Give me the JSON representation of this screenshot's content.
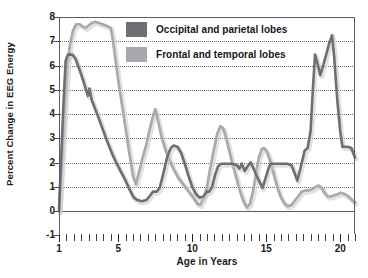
{
  "chart_data": {
    "type": "line",
    "title": "",
    "xlabel": "Age in Years",
    "ylabel": "Percent Change in EEG Energy",
    "xlim": [
      1,
      21
    ],
    "ylim": [
      -1,
      8
    ],
    "yticks": [
      8,
      7,
      6,
      5,
      4,
      3,
      2,
      1,
      0,
      -1
    ],
    "xticks_major": [
      1,
      5,
      10,
      15,
      20
    ],
    "xtick_minor_step": 0.5,
    "grid": "horizontal-dotted",
    "legend_position": "top-center",
    "colors": {
      "occipital_parietal": "#6e6e73",
      "frontal_temporal": "#a8a8ad",
      "axis": "#5a5a6a",
      "grid": "#6b6b6b",
      "text": "#1a1a1a",
      "background": "#ffffff"
    },
    "series": [
      {
        "name": "Occipital and parietal lobes",
        "color": "#6e6e73",
        "points": [
          [
            1.0,
            0.05
          ],
          [
            1.15,
            2.2
          ],
          [
            1.3,
            4.4
          ],
          [
            1.45,
            6.2
          ],
          [
            1.6,
            6.45
          ],
          [
            1.9,
            6.45
          ],
          [
            2.1,
            6.3
          ],
          [
            2.35,
            5.9
          ],
          [
            2.6,
            5.45
          ],
          [
            2.8,
            5.05
          ],
          [
            2.95,
            4.75
          ],
          [
            3.05,
            5.05
          ],
          [
            3.2,
            4.6
          ],
          [
            3.45,
            4.2
          ],
          [
            3.7,
            3.8
          ],
          [
            4.0,
            3.3
          ],
          [
            4.3,
            2.8
          ],
          [
            4.6,
            2.35
          ],
          [
            4.9,
            1.95
          ],
          [
            5.2,
            1.6
          ],
          [
            5.5,
            1.25
          ],
          [
            5.8,
            0.85
          ],
          [
            6.05,
            0.55
          ],
          [
            6.3,
            0.45
          ],
          [
            6.6,
            0.4
          ],
          [
            6.9,
            0.45
          ],
          [
            7.1,
            0.6
          ],
          [
            7.35,
            0.8
          ],
          [
            7.6,
            0.8
          ],
          [
            7.8,
            0.95
          ],
          [
            8.05,
            1.55
          ],
          [
            8.3,
            2.2
          ],
          [
            8.55,
            2.6
          ],
          [
            8.75,
            2.7
          ],
          [
            9.0,
            2.65
          ],
          [
            9.25,
            2.4
          ],
          [
            9.5,
            1.95
          ],
          [
            9.75,
            1.45
          ],
          [
            10.0,
            1.0
          ],
          [
            10.25,
            0.7
          ],
          [
            10.5,
            0.55
          ],
          [
            10.75,
            0.6
          ],
          [
            11.0,
            0.8
          ],
          [
            11.15,
            0.8
          ],
          [
            11.35,
            1.0
          ],
          [
            11.55,
            1.5
          ],
          [
            11.75,
            1.85
          ],
          [
            11.95,
            1.95
          ],
          [
            12.3,
            1.95
          ],
          [
            12.7,
            1.95
          ],
          [
            13.0,
            1.9
          ],
          [
            13.2,
            1.75
          ],
          [
            13.35,
            1.95
          ],
          [
            13.55,
            1.65
          ],
          [
            13.75,
            1.85
          ],
          [
            13.95,
            2.0
          ],
          [
            14.15,
            1.75
          ],
          [
            14.35,
            1.45
          ],
          [
            14.55,
            1.2
          ],
          [
            14.75,
            0.95
          ],
          [
            14.95,
            1.35
          ],
          [
            15.15,
            1.75
          ],
          [
            15.3,
            1.95
          ],
          [
            15.6,
            1.95
          ],
          [
            16.0,
            1.95
          ],
          [
            16.4,
            1.95
          ],
          [
            16.7,
            1.9
          ],
          [
            16.9,
            1.6
          ],
          [
            17.1,
            1.25
          ],
          [
            17.35,
            1.85
          ],
          [
            17.6,
            2.5
          ],
          [
            17.8,
            2.6
          ],
          [
            18.0,
            3.3
          ],
          [
            18.15,
            5.0
          ],
          [
            18.3,
            6.45
          ],
          [
            18.5,
            6.0
          ],
          [
            18.65,
            5.6
          ],
          [
            18.85,
            6.0
          ],
          [
            19.05,
            6.45
          ],
          [
            19.25,
            6.9
          ],
          [
            19.45,
            7.25
          ],
          [
            19.6,
            6.3
          ],
          [
            19.8,
            4.6
          ],
          [
            20.0,
            3.3
          ],
          [
            20.15,
            2.65
          ],
          [
            20.5,
            2.65
          ],
          [
            20.75,
            2.6
          ],
          [
            21.0,
            2.2
          ]
        ]
      },
      {
        "name": "Frontal and temporal lobes",
        "color": "#a8a8ad",
        "points": [
          [
            1.0,
            0.0
          ],
          [
            1.2,
            2.1
          ],
          [
            1.4,
            4.3
          ],
          [
            1.6,
            6.2
          ],
          [
            1.75,
            6.9
          ],
          [
            1.95,
            7.45
          ],
          [
            2.15,
            7.7
          ],
          [
            2.4,
            7.7
          ],
          [
            2.6,
            7.6
          ],
          [
            2.8,
            7.55
          ],
          [
            3.0,
            7.65
          ],
          [
            3.2,
            7.75
          ],
          [
            3.45,
            7.8
          ],
          [
            3.7,
            7.75
          ],
          [
            3.95,
            7.7
          ],
          [
            4.15,
            7.65
          ],
          [
            4.35,
            7.6
          ],
          [
            4.5,
            7.55
          ],
          [
            4.65,
            7.0
          ],
          [
            4.85,
            6.1
          ],
          [
            5.05,
            5.2
          ],
          [
            5.3,
            4.2
          ],
          [
            5.55,
            3.2
          ],
          [
            5.8,
            2.2
          ],
          [
            6.0,
            1.45
          ],
          [
            6.2,
            1.1
          ],
          [
            6.4,
            1.6
          ],
          [
            6.65,
            2.2
          ],
          [
            6.9,
            2.75
          ],
          [
            7.1,
            3.3
          ],
          [
            7.3,
            3.8
          ],
          [
            7.5,
            4.2
          ],
          [
            7.7,
            3.7
          ],
          [
            7.9,
            3.15
          ],
          [
            8.15,
            2.6
          ],
          [
            8.4,
            2.2
          ],
          [
            8.65,
            1.85
          ],
          [
            8.9,
            1.55
          ],
          [
            9.15,
            1.3
          ],
          [
            9.4,
            1.1
          ],
          [
            9.65,
            0.9
          ],
          [
            9.9,
            0.7
          ],
          [
            10.15,
            0.5
          ],
          [
            10.35,
            0.3
          ],
          [
            10.55,
            0.25
          ],
          [
            10.75,
            0.5
          ],
          [
            11.0,
            1.0
          ],
          [
            11.2,
            1.7
          ],
          [
            11.45,
            2.5
          ],
          [
            11.7,
            3.2
          ],
          [
            11.9,
            3.5
          ],
          [
            12.1,
            3.4
          ],
          [
            12.3,
            3.0
          ],
          [
            12.5,
            2.5
          ],
          [
            12.7,
            2.0
          ],
          [
            12.9,
            1.55
          ],
          [
            13.1,
            1.1
          ],
          [
            13.3,
            0.7
          ],
          [
            13.5,
            0.35
          ],
          [
            13.7,
            0.15
          ],
          [
            13.9,
            0.3
          ],
          [
            14.1,
            0.8
          ],
          [
            14.3,
            1.5
          ],
          [
            14.5,
            2.2
          ],
          [
            14.7,
            2.55
          ],
          [
            14.85,
            2.6
          ],
          [
            15.05,
            2.45
          ],
          [
            15.25,
            2.1
          ],
          [
            15.45,
            1.65
          ],
          [
            15.65,
            1.2
          ],
          [
            15.85,
            0.8
          ],
          [
            16.05,
            0.5
          ],
          [
            16.25,
            0.3
          ],
          [
            16.45,
            0.2
          ],
          [
            16.7,
            0.25
          ],
          [
            16.9,
            0.4
          ],
          [
            17.15,
            0.6
          ],
          [
            17.4,
            0.8
          ],
          [
            17.65,
            0.85
          ],
          [
            17.9,
            0.85
          ],
          [
            18.1,
            0.9
          ],
          [
            18.35,
            1.0
          ],
          [
            18.55,
            1.05
          ],
          [
            18.75,
            0.95
          ],
          [
            18.95,
            0.75
          ],
          [
            19.15,
            0.6
          ],
          [
            19.35,
            0.6
          ],
          [
            19.6,
            0.65
          ],
          [
            19.85,
            0.7
          ],
          [
            20.05,
            0.75
          ],
          [
            20.3,
            0.7
          ],
          [
            20.55,
            0.6
          ],
          [
            20.8,
            0.45
          ],
          [
            21.0,
            0.35
          ]
        ]
      }
    ]
  },
  "axes": {
    "ylabel": "Percent Change in EEG Energy",
    "xlabel": "Age in Years",
    "yticks": [
      "8",
      "7",
      "6",
      "5",
      "4",
      "3",
      "2",
      "1",
      "0",
      "-1"
    ],
    "xticks": [
      "1",
      "5",
      "10",
      "15",
      "20"
    ]
  },
  "legend": {
    "items": [
      {
        "label": "Occipital and parietal lobes",
        "color": "#6e6e73"
      },
      {
        "label": "Frontal and temporal lobes",
        "color": "#a8a8ad"
      }
    ]
  }
}
